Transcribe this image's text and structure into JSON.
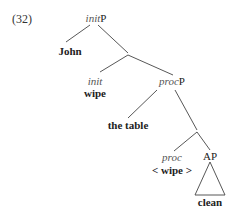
{
  "example_number": "(32)",
  "tree": {
    "root": {
      "italic": "init",
      "plain": "P"
    },
    "specifier": "John",
    "init_head": {
      "label": "init",
      "word": "wipe"
    },
    "proc_phrase": {
      "italic": "proc",
      "plain": "P"
    },
    "proc_specifier": "the table",
    "proc_head": {
      "label": "proc",
      "word": "< wipe >"
    },
    "complement": {
      "label": "AP",
      "word": "clean"
    }
  }
}
